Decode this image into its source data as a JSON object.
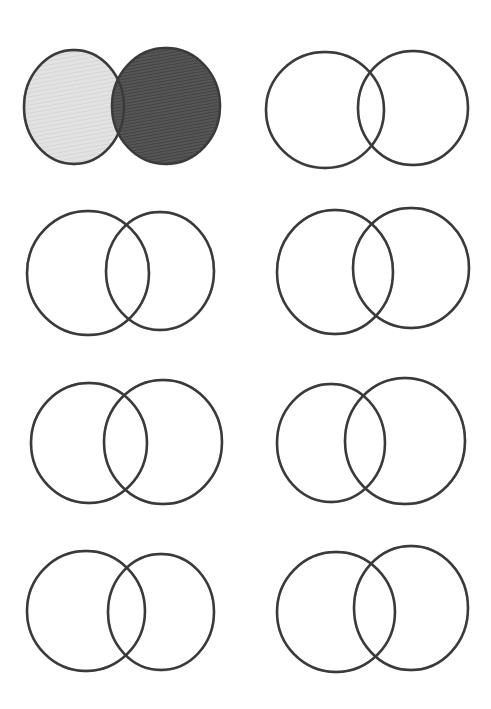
{
  "colors": {
    "background": "#ffffff",
    "outline": "#3a3a3a",
    "light_shade": "#dcdcdc",
    "dark_shade": "#4a4a4a"
  },
  "diagrams": [
    {
      "id": "venn-1",
      "shaded": true,
      "left": {
        "cx": 74,
        "cy": 107,
        "rx": 50,
        "ry": 57,
        "fill": "#dcdcdc"
      },
      "right": {
        "cx": 166,
        "cy": 106,
        "rx": 54,
        "ry": 58,
        "fill": "#4a4a4a"
      }
    },
    {
      "id": "venn-2",
      "shaded": false,
      "left": {
        "cx": 325,
        "cy": 110,
        "rx": 59,
        "ry": 58
      },
      "right": {
        "cx": 413,
        "cy": 108,
        "rx": 55,
        "ry": 57
      }
    },
    {
      "id": "venn-3",
      "shaded": false,
      "left": {
        "cx": 88,
        "cy": 273,
        "rx": 61,
        "ry": 62
      },
      "right": {
        "cx": 160,
        "cy": 271,
        "rx": 54,
        "ry": 59
      }
    },
    {
      "id": "venn-4",
      "shaded": false,
      "left": {
        "cx": 335,
        "cy": 272,
        "rx": 58,
        "ry": 62
      },
      "right": {
        "cx": 411,
        "cy": 268,
        "rx": 58,
        "ry": 60
      }
    },
    {
      "id": "venn-5",
      "shaded": false,
      "left": {
        "cx": 89,
        "cy": 443,
        "rx": 58,
        "ry": 60
      },
      "right": {
        "cx": 163,
        "cy": 442,
        "rx": 59,
        "ry": 62
      }
    },
    {
      "id": "venn-6",
      "shaded": false,
      "left": {
        "cx": 331,
        "cy": 443,
        "rx": 54,
        "ry": 59
      },
      "right": {
        "cx": 405,
        "cy": 441,
        "rx": 60,
        "ry": 63
      }
    },
    {
      "id": "venn-7",
      "shaded": false,
      "left": {
        "cx": 86,
        "cy": 611,
        "rx": 59,
        "ry": 60
      },
      "right": {
        "cx": 161,
        "cy": 612,
        "rx": 53,
        "ry": 58
      }
    },
    {
      "id": "venn-8",
      "shaded": false,
      "left": {
        "cx": 336,
        "cy": 612,
        "rx": 59,
        "ry": 60
      },
      "right": {
        "cx": 411,
        "cy": 608,
        "rx": 57,
        "ry": 62
      }
    }
  ]
}
